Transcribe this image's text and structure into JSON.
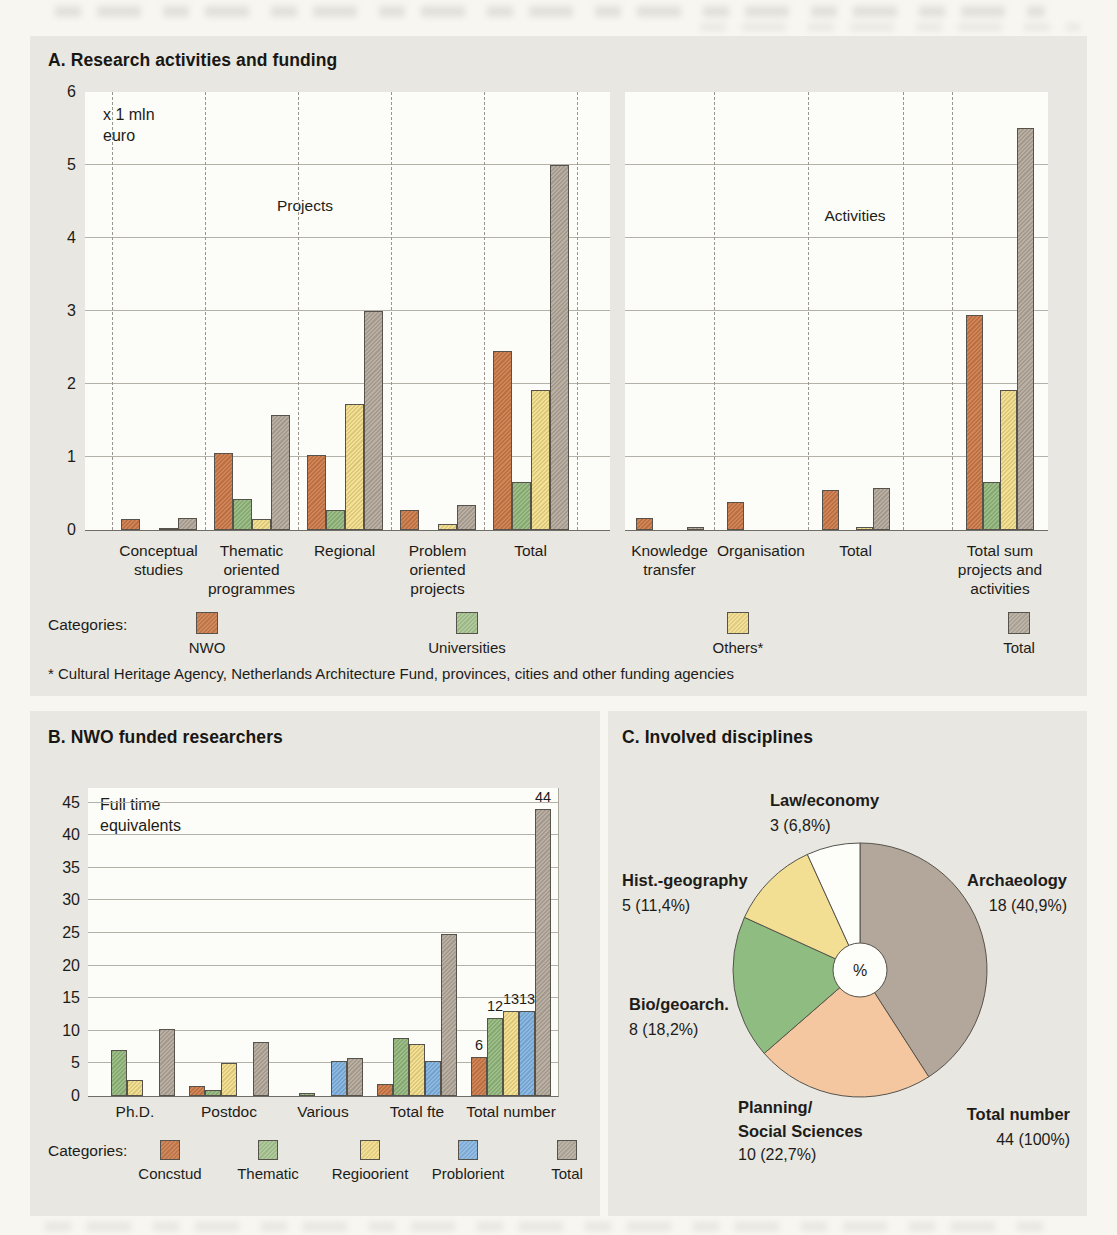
{
  "page": {
    "panel_a": {
      "title": "A. Research activities and funding",
      "y_unit_label_lines": [
        "x 1 mln",
        "euro"
      ],
      "y_ticks": [
        "0",
        "1",
        "2",
        "3",
        "4",
        "5",
        "6"
      ],
      "left_plot_label": "Projects",
      "right_plot_label": "Activities",
      "legend_label": "Categories:",
      "legend_items": [
        {
          "name": "NWO",
          "color": "#cd7f50"
        },
        {
          "name": "Universities",
          "color": "#aac794"
        },
        {
          "name": "Others*",
          "color": "#f3dd8e"
        },
        {
          "name": "Total",
          "color": "#b9afa2"
        }
      ],
      "footnote": "* Cultural Heritage Agency, Netherlands Architecture Fund, provinces, cities and other funding agencies"
    },
    "panel_b": {
      "title": "B. NWO funded researchers",
      "y_unit_label_lines": [
        "Full time",
        "equivalents"
      ],
      "y_ticks": [
        "0",
        "5",
        "10",
        "15",
        "20",
        "25",
        "30",
        "35",
        "40",
        "45"
      ],
      "legend_label": "Categories:",
      "legend_items": [
        {
          "name": "Concstud",
          "color": "#cd7f50"
        },
        {
          "name": "Thematic",
          "color": "#aac794"
        },
        {
          "name": "Regioorient",
          "color": "#f3dd8e"
        },
        {
          "name": "Problorient",
          "color": "#8bb9e4"
        },
        {
          "name": "Total",
          "color": "#b9afa2"
        }
      ]
    },
    "panel_c": {
      "title": "C. Involved disciplines"
    }
  },
  "chart_data": [
    {
      "id": "projects",
      "type": "bar",
      "title": "Projects",
      "ylabel": "x 1 mln euro",
      "ylim": [
        0,
        6
      ],
      "grid": true,
      "categories": [
        [
          "Conceptual",
          "studies"
        ],
        [
          "Thematic",
          "oriented",
          "programmes"
        ],
        [
          "Regional"
        ],
        [
          "Problem",
          "oriented",
          "projects"
        ],
        [
          "Total"
        ]
      ],
      "series": [
        {
          "name": "NWO",
          "values": [
            0.15,
            1.05,
            1.03,
            0.27,
            2.45
          ]
        },
        {
          "name": "Universities",
          "values": [
            0,
            0.43,
            0.27,
            0,
            0.66
          ]
        },
        {
          "name": "Others*",
          "values": [
            0.03,
            0.15,
            1.72,
            0.08,
            1.92
          ]
        },
        {
          "name": "Total",
          "values": [
            0.16,
            1.58,
            3.0,
            0.34,
            5.0
          ]
        }
      ]
    },
    {
      "id": "activities",
      "type": "bar",
      "title": "Activities",
      "ylabel": "x 1 mln euro",
      "ylim": [
        0,
        6
      ],
      "grid": true,
      "categories": [
        [
          "Knowledge",
          "transfer"
        ],
        [
          "Organisation"
        ],
        [
          "Total"
        ],
        [
          "Total sum",
          "projects and",
          "activities"
        ]
      ],
      "series": [
        {
          "name": "NWO",
          "values": [
            0.17,
            0.38,
            0.55,
            2.95
          ]
        },
        {
          "name": "Universities",
          "values": [
            0,
            0,
            0,
            0.66
          ]
        },
        {
          "name": "Others*",
          "values": [
            0,
            0,
            0.04,
            1.92
          ]
        },
        {
          "name": "Total",
          "values": [
            0.04,
            0,
            0.58,
            5.5
          ]
        }
      ]
    },
    {
      "id": "researchers",
      "type": "bar",
      "title": "B. NWO funded researchers",
      "ylabel": "Full time equivalents",
      "ylim": [
        0,
        47
      ],
      "grid": true,
      "categories": [
        [
          "Ph.D."
        ],
        [
          "Postdoc"
        ],
        [
          "Various"
        ],
        [
          "Total fte"
        ],
        [
          "Total number"
        ]
      ],
      "series": [
        {
          "name": "Concstud",
          "values": [
            0,
            1.6,
            0,
            1.8,
            6
          ],
          "labels": [
            null,
            null,
            null,
            null,
            "6"
          ]
        },
        {
          "name": "Thematic",
          "values": [
            7,
            0.9,
            0.4,
            8.9,
            12
          ],
          "labels": [
            null,
            null,
            null,
            null,
            "12"
          ]
        },
        {
          "name": "Regioorient",
          "values": [
            2.5,
            5.1,
            0,
            8.0,
            13
          ],
          "labels": [
            null,
            null,
            null,
            null,
            "13"
          ]
        },
        {
          "name": "Problorient",
          "values": [
            0,
            0,
            5.4,
            5.4,
            13
          ],
          "labels": [
            null,
            null,
            null,
            null,
            "13"
          ]
        },
        {
          "name": "Total",
          "values": [
            10.3,
            8.3,
            5.9,
            24.9,
            44
          ],
          "labels": [
            null,
            null,
            null,
            null,
            "44"
          ]
        }
      ]
    },
    {
      "id": "disciplines",
      "type": "pie",
      "title": "C. Involved disciplines",
      "start_angle_deg": 0,
      "direction": "clockwise",
      "center_label": "%",
      "slices": [
        {
          "name": "Archaeology",
          "count": 18,
          "pct": 40.9,
          "label_lines": [
            "Archaeology",
            "18 (40,9%)"
          ],
          "color": "#b3a79b"
        },
        {
          "name": "Planning/Social Sciences",
          "count": 10,
          "pct": 22.7,
          "label_lines": [
            "Planning/",
            "Social Sciences",
            "10 (22,7%)"
          ],
          "color": "#f4c7a0"
        },
        {
          "name": "Bio/geoarch.",
          "count": 8,
          "pct": 18.2,
          "label_lines": [
            "Bio/geoarch.",
            "8 (18,2%)"
          ],
          "color": "#8fbc81"
        },
        {
          "name": "Hist.-geography",
          "count": 5,
          "pct": 11.4,
          "label_lines": [
            "Hist.-geography",
            "5 (11,4%)"
          ],
          "color": "#f2df93"
        },
        {
          "name": "Law/economy",
          "count": 3,
          "pct": 6.8,
          "label_lines": [
            "Law/economy",
            "3 (6,8%)"
          ],
          "color": "#fdfdfa"
        }
      ],
      "total": {
        "label_lines": [
          "Total number",
          "44 (100%)"
        ]
      }
    }
  ]
}
